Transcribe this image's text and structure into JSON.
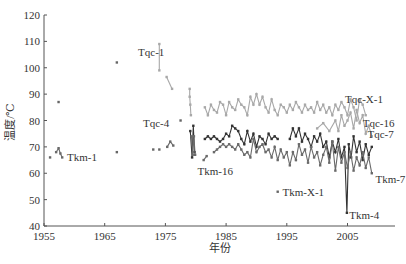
{
  "chart_data": {
    "type": "line",
    "title": "",
    "xlabel": "年份",
    "ylabel": "温度/℃",
    "xlim": [
      1955,
      2013
    ],
    "ylim": [
      40,
      120
    ],
    "x_ticks": [
      1955,
      1965,
      1975,
      1985,
      1995,
      2005
    ],
    "y_ticks": [
      40,
      50,
      60,
      70,
      80,
      90,
      100,
      110,
      120
    ],
    "grid": false,
    "legend": "none (inline labels)",
    "annotations": [
      {
        "text": "Tqc-1",
        "x": 1970.5,
        "y": 106
      },
      {
        "text": "Tqc-4",
        "x": 1971.3,
        "y": 79
      },
      {
        "text": "Tkm-1",
        "x": 1958.8,
        "y": 66
      },
      {
        "text": "Tkm-16",
        "x": 1980.3,
        "y": 61
      },
      {
        "text": "Tkm-X-1",
        "x": 1994.3,
        "y": 53
      },
      {
        "text": "Tkm-4",
        "x": 2005.3,
        "y": 44
      },
      {
        "text": "Tkm-7",
        "x": 2009.6,
        "y": 58
      },
      {
        "text": "Tqc-X-1",
        "x": 2004.6,
        "y": 88
      },
      {
        "text": "Tqc-16",
        "x": 2007.5,
        "y": 79
      },
      {
        "text": "Tqc-7",
        "x": 2008.3,
        "y": 75
      }
    ],
    "series": [
      {
        "name": "Tqc (upper, light gray)",
        "color": "#a8a8a8",
        "segments": [
          [
            [
              1974.0,
              109
            ],
            [
              1974.0,
              99
            ]
          ],
          [
            [
              1975.2,
              96.5
            ],
            [
              1976.1,
              92
            ]
          ],
          [
            [
              1979.0,
              92
            ],
            [
              1979.0,
              89
            ],
            [
              1979.1,
              86
            ],
            [
              1979.2,
              82
            ]
          ],
          [
            [
              1981.5,
              85
            ],
            [
              1982.0,
              82
            ],
            [
              1982.5,
              86
            ],
            [
              1983.0,
              84
            ],
            [
              1983.5,
              83
            ],
            [
              1984.0,
              87
            ],
            [
              1984.5,
              86
            ],
            [
              1985.0,
              82
            ],
            [
              1985.5,
              87
            ],
            [
              1986.0,
              85
            ],
            [
              1986.5,
              84
            ],
            [
              1987.0,
              88
            ],
            [
              1987.5,
              86
            ],
            [
              1988.0,
              85
            ],
            [
              1988.5,
              82
            ],
            [
              1989.0,
              89
            ],
            [
              1989.5,
              86
            ],
            [
              1990.0,
              90
            ],
            [
              1990.5,
              86
            ],
            [
              1991.0,
              89
            ],
            [
              1991.5,
              85
            ],
            [
              1992.0,
              83
            ],
            [
              1992.5,
              88
            ],
            [
              1993.0,
              84
            ],
            [
              1993.5,
              82
            ],
            [
              1994.0,
              86
            ],
            [
              1994.5,
              85
            ],
            [
              1995.0,
              83
            ],
            [
              1995.5,
              86
            ],
            [
              1996.0,
              84
            ],
            [
              1996.5,
              87
            ],
            [
              1997.0,
              85
            ],
            [
              1997.5,
              83
            ],
            [
              1998.0,
              86
            ],
            [
              1998.5,
              84
            ],
            [
              1999.0,
              85
            ],
            [
              1999.5,
              83
            ],
            [
              2000.0,
              87
            ],
            [
              2000.5,
              84
            ],
            [
              2001.0,
              86
            ],
            [
              2001.5,
              83
            ],
            [
              2002.0,
              85
            ],
            [
              2002.5,
              82
            ],
            [
              2003.0,
              86
            ],
            [
              2003.5,
              84
            ],
            [
              2004.0,
              87
            ],
            [
              2004.5,
              85
            ],
            [
              2005.0,
              82
            ],
            [
              2005.5,
              88
            ],
            [
              2006.0,
              85
            ],
            [
              2006.5,
              80
            ],
            [
              2007.0,
              88
            ],
            [
              2007.5,
              86
            ],
            [
              2008.0,
              82
            ]
          ],
          [
            [
              2000.0,
              77
            ],
            [
              2001.0,
              79
            ],
            [
              2002.0,
              76
            ],
            [
              2003.0,
              80
            ],
            [
              2003.5,
              76
            ],
            [
              2004.0,
              82
            ],
            [
              2004.5,
              78
            ],
            [
              2005.0,
              80
            ],
            [
              2005.5,
              83
            ],
            [
              2006.0,
              77
            ],
            [
              2006.5,
              84
            ],
            [
              2007.0,
              79
            ],
            [
              2007.5,
              82
            ],
            [
              2008.0,
              75
            ],
            [
              2008.5,
              78
            ],
            [
              2009.0,
              74
            ]
          ]
        ]
      },
      {
        "name": "Tkm (middle, dark)",
        "color": "#333333",
        "segments": [
          [
            [
              1979.1,
              76
            ],
            [
              1979.4,
              66
            ],
            [
              1979.6,
              78
            ],
            [
              1979.8,
              68
            ]
          ],
          [
            [
              1981.5,
              73
            ],
            [
              1982.0,
              74
            ],
            [
              1982.5,
              73
            ],
            [
              1983.0,
              74
            ],
            [
              1983.5,
              73
            ],
            [
              1984.0,
              72
            ],
            [
              1984.5,
              73
            ],
            [
              1985.0,
              75
            ],
            [
              1985.5,
              74
            ],
            [
              1986.0,
              78
            ],
            [
              1986.5,
              77
            ],
            [
              1987.0,
              76
            ],
            [
              1987.5,
              73
            ],
            [
              1988.0,
              71
            ],
            [
              1988.5,
              76
            ],
            [
              1989.0,
              72
            ],
            [
              1989.5,
              75
            ],
            [
              1990.0,
              70
            ],
            [
              1990.5,
              74
            ],
            [
              1991.0,
              73
            ],
            [
              1991.5,
              71
            ],
            [
              1992.0,
              75
            ],
            [
              1992.5,
              73
            ],
            [
              1993.0,
              74
            ],
            [
              1993.5,
              73
            ]
          ],
          [
            [
              1995.5,
              73
            ],
            [
              1996.0,
              77
            ],
            [
              1996.5,
              74
            ],
            [
              1997.0,
              77
            ],
            [
              1997.5,
              72
            ],
            [
              1998.0,
              75
            ],
            [
              1998.5,
              73
            ],
            [
              1999.0,
              70
            ],
            [
              1999.5,
              74
            ],
            [
              2000.0,
              72
            ],
            [
              2000.5,
              75
            ],
            [
              2001.0,
              70
            ],
            [
              2001.5,
              72
            ],
            [
              2002.0,
              66
            ],
            [
              2002.5,
              72
            ],
            [
              2003.0,
              68
            ],
            [
              2003.5,
              73
            ],
            [
              2004.0,
              66
            ],
            [
              2004.5,
              70
            ],
            [
              2004.9,
              45
            ],
            [
              2005.2,
              71
            ],
            [
              2005.6,
              66
            ],
            [
              2006.0,
              74
            ],
            [
              2006.5,
              68
            ],
            [
              2007.0,
              72
            ],
            [
              2007.5,
              65
            ],
            [
              2008.0,
              71
            ],
            [
              2008.5,
              67
            ],
            [
              2009.0,
              70
            ]
          ]
        ]
      },
      {
        "name": "Tkm (lower, mid gray)",
        "color": "#6a6a6a",
        "segments": [
          [
            [
              1957.0,
              68
            ],
            [
              1957.4,
              69.5
            ],
            [
              1957.7,
              67.5
            ],
            [
              1958.0,
              66
            ]
          ],
          [
            [
              1975.3,
              70
            ],
            [
              1975.8,
              72
            ],
            [
              1976.3,
              70.5
            ]
          ],
          [
            [
              1979.3,
              74
            ],
            [
              1979.5,
              67
            ],
            [
              1979.7,
              74
            ],
            [
              1979.9,
              67
            ]
          ],
          [
            [
              1981.3,
              65
            ],
            [
              1981.8,
              66.5
            ]
          ],
          [
            [
              1983.0,
              68
            ],
            [
              1983.5,
              69
            ],
            [
              1984.0,
              70
            ],
            [
              1984.5,
              71
            ],
            [
              1985.0,
              70
            ],
            [
              1985.5,
              71
            ],
            [
              1986.0,
              70
            ],
            [
              1986.5,
              69
            ],
            [
              1987.0,
              71
            ],
            [
              1987.5,
              69
            ],
            [
              1988.0,
              67
            ],
            [
              1988.5,
              68
            ],
            [
              1989.0,
              66
            ],
            [
              1989.5,
              73
            ],
            [
              1990.0,
              68
            ],
            [
              1990.5,
              70
            ],
            [
              1991.0,
              71
            ],
            [
              1991.5,
              68
            ],
            [
              1992.0,
              69
            ],
            [
              1992.5,
              66
            ],
            [
              1993.0,
              70
            ],
            [
              1993.5,
              65
            ],
            [
              1994.0,
              69
            ],
            [
              1994.5,
              66
            ],
            [
              1995.0,
              68
            ],
            [
              1995.5,
              63
            ],
            [
              1996.0,
              68
            ],
            [
              1996.5,
              65
            ],
            [
              1997.0,
              71
            ],
            [
              1997.5,
              67
            ],
            [
              1998.0,
              69
            ],
            [
              1998.5,
              64
            ],
            [
              1999.0,
              70
            ],
            [
              1999.5,
              66
            ],
            [
              2000.0,
              68
            ],
            [
              2000.5,
              63
            ],
            [
              2001.0,
              67
            ],
            [
              2001.5,
              70
            ],
            [
              2002.0,
              64
            ],
            [
              2002.5,
              72
            ],
            [
              2003.0,
              61
            ],
            [
              2003.5,
              70
            ],
            [
              2004.0,
              64
            ],
            [
              2004.5,
              68
            ],
            [
              2005.0,
              62
            ],
            [
              2005.5,
              68
            ],
            [
              2006.0,
              61
            ],
            [
              2006.5,
              66
            ],
            [
              2007.0,
              63
            ],
            [
              2007.5,
              68
            ],
            [
              2008.0,
              62
            ],
            [
              2008.5,
              66
            ],
            [
              2009.0,
              60
            ]
          ]
        ]
      },
      {
        "name": "Isolated points",
        "color": "#666666",
        "points": [
          [
            1956.0,
            66
          ],
          [
            1957.4,
            87
          ],
          [
            1967.0,
            102
          ],
          [
            1967.0,
            68
          ],
          [
            1973.0,
            69
          ],
          [
            1974.0,
            69
          ],
          [
            1977.5,
            80
          ],
          [
            1993.5,
            53
          ]
        ]
      }
    ]
  }
}
